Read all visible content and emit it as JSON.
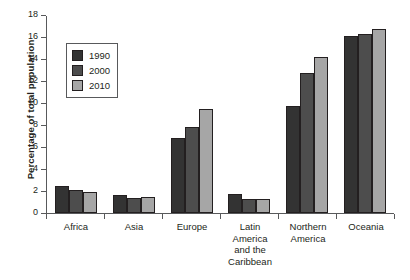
{
  "chart_data": {
    "type": "bar",
    "title": "",
    "subtitle": "",
    "xlabel": "",
    "ylabel": "Percentage of total population",
    "categories": [
      "Africa",
      "Asia",
      "Europe",
      "Latin America and the Caribbean",
      "Northern America",
      "Oceania"
    ],
    "category_lines": [
      [
        "Africa"
      ],
      [
        "Asia"
      ],
      [
        "Europe"
      ],
      [
        "Latin",
        "America",
        "and the",
        "Caribbean"
      ],
      [
        "Northern",
        "America"
      ],
      [
        "Oceania"
      ]
    ],
    "series": [
      {
        "name": "1990",
        "color": "#333333",
        "values": [
          2.5,
          1.6,
          6.8,
          1.7,
          9.7,
          16.1
        ]
      },
      {
        "name": "2000",
        "color": "#4d4d4d",
        "values": [
          2.1,
          1.4,
          7.8,
          1.3,
          12.7,
          16.3
        ]
      },
      {
        "name": "2010",
        "color": "#a6a6a6",
        "values": [
          1.9,
          1.5,
          9.5,
          1.3,
          14.2,
          16.7
        ]
      }
    ],
    "ylim": [
      0,
      18
    ],
    "yticks": [
      0,
      2,
      4,
      6,
      8,
      10,
      12,
      14,
      16,
      18
    ],
    "ytick_labels": [
      "0",
      "2",
      "4",
      "6",
      "8",
      "10",
      "12",
      "14",
      "16",
      "18"
    ],
    "grid": false,
    "legend": {
      "position": "upper-left-inside",
      "entries": [
        "1990",
        "2000",
        "2010"
      ]
    },
    "axis_color": "#58595b",
    "bar_edge_color": "#231f20",
    "background": "#ffffff"
  }
}
